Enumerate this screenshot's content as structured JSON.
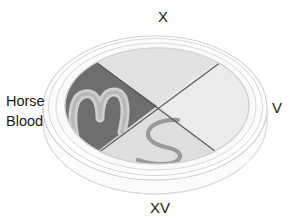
{
  "figure": {
    "type": "petri-dish-quadrant-diagram"
  },
  "labels": {
    "top": "X",
    "right": "V",
    "bottom": "XV",
    "left_line1": "Horse",
    "left_line2": "Blood"
  },
  "quadrants": [
    {
      "id": "top",
      "label": "X",
      "fill": "#e2e2e2",
      "streak": false
    },
    {
      "id": "right",
      "label": "V",
      "fill": "#ebebeb",
      "streak": false
    },
    {
      "id": "bottom",
      "label": "XV",
      "fill": "#dedede",
      "streak": true,
      "streak_color": "#9a9a9a"
    },
    {
      "id": "left",
      "label": "Horse Blood",
      "fill": "#6e6e6e",
      "streak": true,
      "streak_color": "#cfcfcf"
    }
  ],
  "colors": {
    "background": "#ffffff",
    "dish_rim": "#cfcfcf",
    "dish_wall": "#f2f2f2",
    "divider_line": "#585858",
    "text": "#1a1a1a",
    "agar_top": "#e2e2e2",
    "agar_right": "#ebebeb",
    "agar_bottom": "#dedede",
    "agar_left_dark": "#6e6e6e",
    "streak_light": "#cfcfcf",
    "streak_dark": "#9a9a9a"
  }
}
